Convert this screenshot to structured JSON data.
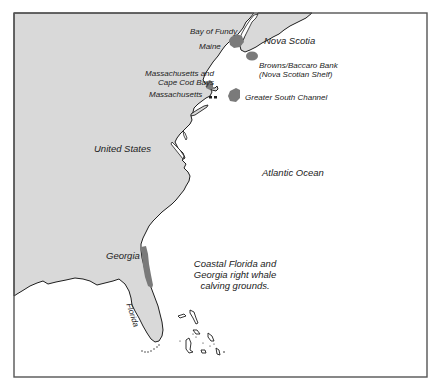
{
  "map": {
    "colors": {
      "land": "#d9d9d9",
      "water": "#ffffff",
      "coastline": "#1e1e1e",
      "habitat": "#7a7a7a",
      "frame": "#555555"
    },
    "labels": {
      "bay_of_fundy": "Bay of Fundy",
      "maine": "Maine",
      "nova_scotia": "Nova Scotia",
      "browns_baccaro_line1": "Browns/Baccaro Bank",
      "browns_baccaro_line2": "(Nova Scotian Shelf)",
      "mass_cape_cod_line1": "Massachusetts and",
      "mass_cape_cod_line2": "Cape Cod Bays",
      "massachusetts": "Massachusetts",
      "greater_south_channel": "Greater South Channel",
      "united_states": "United States",
      "atlantic_ocean": "Atlantic Ocean",
      "georgia": "Georgia",
      "florida": "Florida",
      "calving_line1": "Coastal Florida and",
      "calving_line2": "Georgia right whale",
      "calving_line3": "calving grounds."
    },
    "habitat_areas": [
      "Bay of Fundy",
      "Browns/Baccaro Bank",
      "Massachusetts and Cape Cod Bays",
      "Greater South Channel",
      "Coastal Florida and Georgia calving grounds"
    ]
  }
}
